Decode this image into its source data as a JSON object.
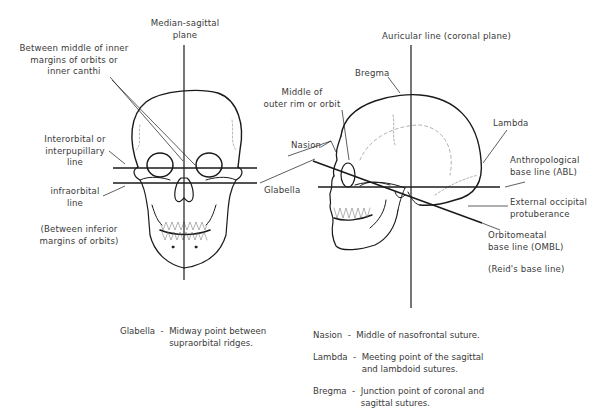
{
  "frontal_view": {
    "labels": {
      "median_sagittal": "Median-sagittal\nplane",
      "inner_canthi": "Between middle of inner\nmargins of orbits or\ninner canthi",
      "interorbital": "Interorbital or\ninterpupillary\nline",
      "infraorbital": "infraorbital\nline",
      "infraorbital_note": "(Between inferior\nmargins of orbits)"
    }
  },
  "lateral_view": {
    "labels": {
      "auricular": "Auricular line (coronal plane)",
      "bregma": "Bregma",
      "outer_rim": "Middle of\nouter rim or orbit",
      "nasion": "Nasion",
      "glabella": "Glabella",
      "lambda": "Lambda",
      "abl": "Anthropological\nbase line (ABL)",
      "occipital": "External occipital\nprotuberance",
      "ombl": "Orbitomeatal\nbase line (OMBL)",
      "reid": "(Reid's base line)"
    }
  },
  "definitions": {
    "glabella": {
      "term": "Glabella  -  ",
      "text": "Midway point between\nsupraorbital ridges."
    },
    "nasion": {
      "term": "Nasion  -  ",
      "text": "Middle of nasofrontal suture."
    },
    "lambda": {
      "term": "Lambda  -  ",
      "text": "Meeting point of the sagittal\nand lambdoid sutures."
    },
    "bregma": {
      "term": "Bregma  -  ",
      "text": "Junction point of coronal and\nsagittal sutures."
    }
  },
  "colors": {
    "line": "#1a1a1a",
    "text": "#3a3a3a",
    "dashed": "#9a9a9a"
  }
}
